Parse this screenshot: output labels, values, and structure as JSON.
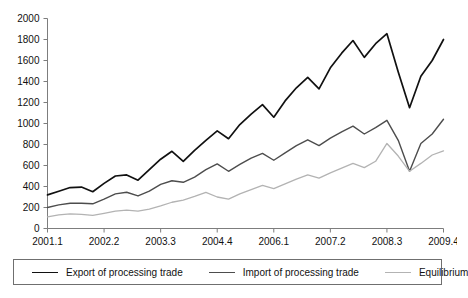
{
  "chart_data": {
    "type": "line",
    "title": "",
    "xlabel": "",
    "ylabel": "",
    "ylim": [
      0,
      2000
    ],
    "ytick_step": 200,
    "ytick_labels": [
      "0",
      "200",
      "400",
      "600",
      "800",
      "1000",
      "1200",
      "1400",
      "1600",
      "1800",
      "2000"
    ],
    "grid": false,
    "legend_position": "bottom",
    "x_tick_labels": [
      "2001.1",
      "2002.2",
      "2003.3",
      "2004.4",
      "2006.1",
      "2007.2",
      "2008.3",
      "2009.4"
    ],
    "x_tick_indices": [
      0,
      5,
      10,
      15,
      20,
      25,
      30,
      35
    ],
    "x": [
      "2001.1",
      "2001.2",
      "2001.3",
      "2001.4",
      "2002.1",
      "2002.2",
      "2002.3",
      "2002.4",
      "2003.1",
      "2003.2",
      "2003.3",
      "2003.4",
      "2004.1",
      "2004.2",
      "2004.3",
      "2004.4",
      "2005.1",
      "2005.2",
      "2005.3",
      "2005.4",
      "2006.1",
      "2006.2",
      "2006.3",
      "2006.4",
      "2007.1",
      "2007.2",
      "2007.3",
      "2007.4",
      "2008.1",
      "2008.2",
      "2008.3",
      "2008.4",
      "2009.1",
      "2009.2",
      "2009.3",
      "2009.4"
    ],
    "series": [
      {
        "name": "Export of processing trade",
        "color": "#111111",
        "width": 1.7,
        "values": [
          320,
          355,
          390,
          395,
          350,
          430,
          500,
          510,
          460,
          560,
          660,
          735,
          640,
          745,
          840,
          930,
          855,
          990,
          1090,
          1180,
          1060,
          1215,
          1340,
          1440,
          1330,
          1530,
          1670,
          1790,
          1630,
          1760,
          1855,
          1490,
          1150,
          1450,
          1600,
          1800
        ]
      },
      {
        "name": "Import of processing trade",
        "color": "#4d4d4d",
        "width": 1.4,
        "values": [
          200,
          225,
          240,
          240,
          235,
          280,
          330,
          345,
          310,
          355,
          420,
          455,
          440,
          490,
          560,
          615,
          545,
          610,
          670,
          715,
          650,
          720,
          790,
          845,
          790,
          860,
          920,
          975,
          900,
          960,
          1030,
          840,
          545,
          810,
          900,
          1040
        ]
      },
      {
        "name": "Equilibrium",
        "color": "#b3b3b3",
        "width": 1.3,
        "values": [
          110,
          130,
          140,
          135,
          125,
          145,
          165,
          175,
          165,
          185,
          215,
          250,
          270,
          305,
          345,
          300,
          280,
          330,
          370,
          410,
          380,
          425,
          470,
          510,
          480,
          530,
          575,
          620,
          580,
          640,
          810,
          690,
          545,
          620,
          700,
          740
        ]
      }
    ]
  },
  "legend": {
    "items": [
      {
        "label": "Export of processing trade"
      },
      {
        "label": "Import of processing trade"
      },
      {
        "label": "Equilibrium"
      }
    ]
  }
}
